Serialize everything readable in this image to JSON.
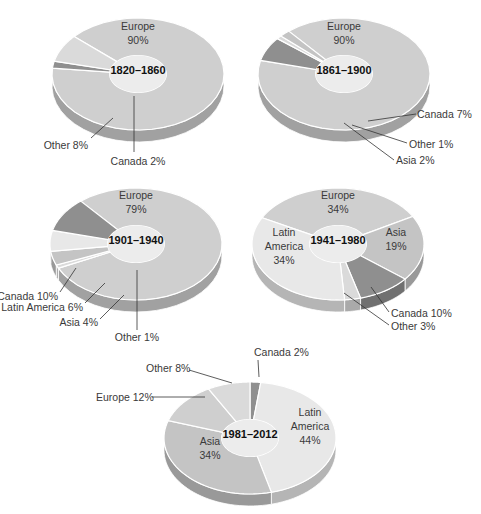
{
  "colors": {
    "europe": "#cfcfcf",
    "other": "#dadada",
    "canada": "#8f8f8f",
    "asia": "#c4c4c4",
    "latin_america": "#e8e8e8",
    "center": "#ececec",
    "edge_dark": "#9a9a9a"
  },
  "chart_data": [
    {
      "type": "pie",
      "title": "1820–1860",
      "categories": [
        "Europe",
        "Canada",
        "Other"
      ],
      "values": [
        90,
        2,
        8
      ],
      "labels": [
        "Europe 90%",
        "Canada 2%",
        "Other 8%"
      ]
    },
    {
      "type": "pie",
      "title": "1861–1900",
      "categories": [
        "Europe",
        "Canada",
        "Other",
        "Asia"
      ],
      "values": [
        90,
        7,
        1,
        2
      ],
      "labels": [
        "Europe 90%",
        "Canada 7%",
        "Other 1%",
        "Asia 2%"
      ]
    },
    {
      "type": "pie",
      "title": "1901–1940",
      "categories": [
        "Europe",
        "Other",
        "Asia",
        "Latin America",
        "Canada"
      ],
      "values": [
        79,
        1,
        4,
        6,
        10
      ],
      "labels": [
        "Europe 79%",
        "Other 1%",
        "Asia 4%",
        "Latin America 6%",
        "Canada 10%"
      ]
    },
    {
      "type": "pie",
      "title": "1941–1980",
      "categories": [
        "Europe",
        "Asia",
        "Canada",
        "Other",
        "Latin America"
      ],
      "values": [
        34,
        19,
        10,
        3,
        34
      ],
      "labels": [
        "Europe 34%",
        "Asia 19%",
        "Canada 10%",
        "Other 3%",
        "Latin America 34%"
      ]
    },
    {
      "type": "pie",
      "title": "1981–2012",
      "categories": [
        "Canada",
        "Latin America",
        "Asia",
        "Europe",
        "Other"
      ],
      "values": [
        2,
        44,
        34,
        12,
        8
      ],
      "labels": [
        "Canada 2%",
        "Latin America 44%",
        "Asia 34%",
        "Europe 12%",
        "Other 8%"
      ]
    }
  ],
  "text": {
    "p1": {
      "center": "1820–1860",
      "europe_name": "Europe",
      "europe_pct": "90%",
      "other": "Other 8%",
      "canada": "Canada 2%"
    },
    "p2": {
      "center": "1861–1900",
      "europe_name": "Europe",
      "europe_pct": "90%",
      "canada": "Canada 7%",
      "other": "Other 1%",
      "asia": "Asia 2%"
    },
    "p3": {
      "center": "1901–1940",
      "europe_name": "Europe",
      "europe_pct": "79%",
      "canada": "Canada 10%",
      "latam": "Latin America 6%",
      "asia": "Asia 4%",
      "other": "Other 1%"
    },
    "p4": {
      "center": "1941–1980",
      "europe_name": "Europe",
      "europe_pct": "34%",
      "asia_name": "Asia",
      "asia_pct": "19%",
      "latam_l1": "Latin",
      "latam_l2": "America",
      "latam_pct": "34%",
      "canada": "Canada 10%",
      "other": "Other 3%"
    },
    "p5": {
      "center": "1981–2012",
      "canada": "Canada 2%",
      "other": "Other 8%",
      "europe": "Europe 12%",
      "latam_l1": "Latin",
      "latam_l2": "America",
      "latam_pct": "44%",
      "asia_name": "Asia",
      "asia_pct": "34%"
    }
  }
}
